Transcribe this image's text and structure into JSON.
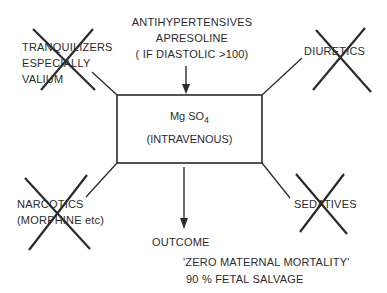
{
  "top": {
    "line1": "ANTIHYPERTENSIVES",
    "line2": "APRESOLINE",
    "line3": "( IF DIASTOLIC >100)"
  },
  "center_box": {
    "line1_main": "Mg SO",
    "line1_sub": "4",
    "line2": "(INTRAVENOUS)"
  },
  "top_left": {
    "line1": "TRANQUILIZERS",
    "line2": "ESPECIALLY",
    "line3": "VALIUM",
    "crossed_out": true
  },
  "top_right": {
    "line1": "DIURETICS",
    "crossed_out": true
  },
  "bottom_left": {
    "line1": "NARCOTICS",
    "line2": "(MORPHINE etc)",
    "crossed_out": true
  },
  "bottom_right": {
    "line1": "SEDATIVES",
    "crossed_out": true
  },
  "outcome": {
    "label": "OUTCOME",
    "line1": "'ZERO MATERNAL MORTALITY'",
    "line2": "90 % FETAL  SALVAGE"
  },
  "colors": {
    "ink": "#2b2b2b",
    "background": "#ffffff"
  }
}
